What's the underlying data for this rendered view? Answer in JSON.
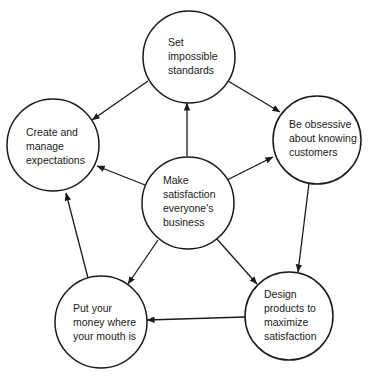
{
  "diagram": {
    "type": "flow-cycle",
    "colors": {
      "stroke": "#1a1a1a",
      "fill": "#ffffff",
      "text": "#1a1a1a"
    },
    "nodes": [
      {
        "id": "set-standards",
        "label": "Set\nimpossible\nstandards",
        "cx": 189,
        "cy": 57,
        "r": 46,
        "text_x": 168,
        "text_y": 35
      },
      {
        "id": "create-expectations",
        "label": "Create and\nmanage\nexpectations",
        "cx": 53,
        "cy": 145,
        "r": 46,
        "text_x": 26,
        "text_y": 125
      },
      {
        "id": "obsessive-customers",
        "label": "Be obsessive\nabout knowing\ncustomers",
        "cx": 317,
        "cy": 140,
        "r": 44,
        "text_x": 289,
        "text_y": 117
      },
      {
        "id": "make-satisfaction",
        "label": "Make\nsatisfaction\neveryone's\nbusiness",
        "cx": 188,
        "cy": 203,
        "r": 46,
        "text_x": 163,
        "text_y": 173
      },
      {
        "id": "put-money",
        "label": "Put your\nmoney where\nyour mouth is",
        "cx": 101,
        "cy": 322,
        "r": 46,
        "text_x": 73,
        "text_y": 301
      },
      {
        "id": "design-products",
        "label": "Design\nproducts to\nmaximize\nsatisfaction",
        "cx": 289,
        "cy": 316,
        "r": 44,
        "text_x": 264,
        "text_y": 287
      }
    ],
    "edges": [
      {
        "from": "make-satisfaction",
        "to": "set-standards",
        "x1": 187,
        "y1": 156,
        "x2": 187,
        "y2": 103
      },
      {
        "from": "make-satisfaction",
        "to": "create-expectations",
        "x1": 145,
        "y1": 185,
        "x2": 97,
        "y2": 166
      },
      {
        "from": "make-satisfaction",
        "to": "obsessive-customers",
        "x1": 227,
        "y1": 180,
        "x2": 273,
        "y2": 157
      },
      {
        "from": "make-satisfaction",
        "to": "put-money",
        "x1": 158,
        "y1": 240,
        "x2": 128,
        "y2": 284
      },
      {
        "from": "make-satisfaction",
        "to": "design-products",
        "x1": 216,
        "y1": 238,
        "x2": 257,
        "y2": 284
      },
      {
        "from": "set-standards",
        "to": "create-expectations",
        "x1": 148,
        "y1": 81,
        "x2": 92,
        "y2": 120
      },
      {
        "from": "set-standards",
        "to": "obsessive-customers",
        "x1": 228,
        "y1": 81,
        "x2": 280,
        "y2": 112
      },
      {
        "from": "obsessive-customers",
        "to": "design-products",
        "x1": 309,
        "y1": 183,
        "x2": 298,
        "y2": 272
      },
      {
        "from": "design-products",
        "to": "put-money",
        "x1": 245,
        "y1": 317,
        "x2": 147,
        "y2": 320
      },
      {
        "from": "put-money",
        "to": "create-expectations",
        "x1": 88,
        "y1": 278,
        "x2": 66,
        "y2": 193
      }
    ]
  }
}
